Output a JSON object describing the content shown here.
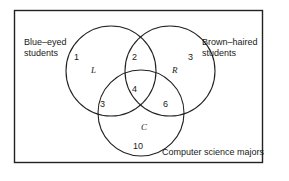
{
  "diagram": {
    "type": "venn",
    "frame": {
      "stroke": "#222222"
    },
    "sets": [
      {
        "id": "L",
        "symbol": "L",
        "label_line1": "Blue–eyed",
        "label_line2": "students"
      },
      {
        "id": "R",
        "symbol": "R",
        "label_line1": "Brown–haired",
        "label_line2": "students"
      },
      {
        "id": "C",
        "symbol": "C",
        "label": "Computer science majors"
      }
    ],
    "regions": {
      "L_only": "1",
      "L_and_R_only": "2",
      "R_only": "3",
      "L_and_R_and_C": "4",
      "L_and_C_only": "3",
      "R_and_C_only": "6",
      "C_only": "10"
    }
  }
}
